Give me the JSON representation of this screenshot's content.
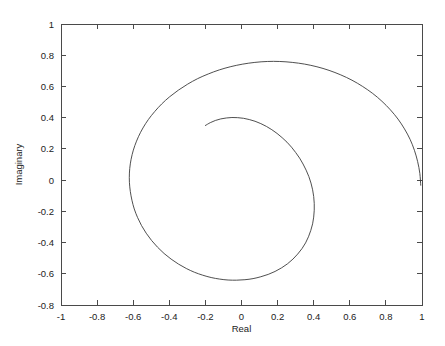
{
  "page": {
    "margin_text": "r\nd\ng",
    "background_color": "#ffffff"
  },
  "chart_data": {
    "type": "line",
    "title": "",
    "subtitle": "",
    "xlabel": "Real",
    "ylabel": "Imaginary",
    "xlim": [
      -1,
      1
    ],
    "ylim": [
      -0.8,
      1
    ],
    "grid": false,
    "legend": null,
    "line_color": "#3b3b3b",
    "axis_color": "#4a4a4a",
    "xticks": [
      -1,
      -0.8,
      -0.6,
      -0.4,
      -0.2,
      0,
      0.2,
      0.4,
      0.6,
      0.8,
      1
    ],
    "xticklabels": [
      "-1",
      "-0.8",
      "-0.6",
      "-0.4",
      "-0.2",
      "0",
      "0.2",
      "0.4",
      "0.6",
      "0.8",
      "1"
    ],
    "yticks": [
      -0.8,
      -0.6,
      -0.4,
      -0.2,
      0,
      0.2,
      0.4,
      0.6,
      0.8,
      1
    ],
    "yticklabels": [
      "-0.8",
      "-0.6",
      "-0.4",
      "-0.2",
      "0",
      "0.2",
      "0.4",
      "0.6",
      "0.8",
      "1"
    ],
    "annotations": [
      {
        "name": "inner-start",
        "x": -0.2,
        "y": 0.35
      },
      {
        "name": "inner-loop-top",
        "x": 0.02,
        "y": 0.4
      },
      {
        "name": "inner-loop-right",
        "x": 0.42,
        "y": 0.02
      },
      {
        "name": "inner-loop-bottom",
        "x": -0.06,
        "y": -0.46
      },
      {
        "name": "inner-loop-left",
        "x": -0.54,
        "y": 0.05
      },
      {
        "name": "mid-loop-top",
        "x": 0.04,
        "y": 0.6
      },
      {
        "name": "mid-loop-right",
        "x": 0.65,
        "y": 0.02
      },
      {
        "name": "mid-loop-bottom",
        "x": -0.08,
        "y": -0.71
      },
      {
        "name": "mid-loop-left",
        "x": -0.83,
        "y": 0.08
      },
      {
        "name": "outer-top",
        "x": 0.05,
        "y": 0.905
      },
      {
        "name": "outer-end",
        "x": 1.0,
        "y": 0.03
      }
    ],
    "series": [
      {
        "name": "spiral",
        "points": [
          [
            -0.2,
            0.35
          ],
          [
            -0.173,
            0.368
          ],
          [
            -0.145,
            0.382
          ],
          [
            -0.115,
            0.392
          ],
          [
            -0.084,
            0.398
          ],
          [
            -0.053,
            0.401
          ],
          [
            -0.021,
            0.4
          ],
          [
            0.011,
            0.396
          ],
          [
            0.043,
            0.388
          ],
          [
            0.075,
            0.377
          ],
          [
            0.107,
            0.362
          ],
          [
            0.138,
            0.344
          ],
          [
            0.168,
            0.323
          ],
          [
            0.197,
            0.299
          ],
          [
            0.225,
            0.272
          ],
          [
            0.252,
            0.243
          ],
          [
            0.277,
            0.211
          ],
          [
            0.3,
            0.177
          ],
          [
            0.322,
            0.141
          ],
          [
            0.341,
            0.103
          ],
          [
            0.358,
            0.064
          ],
          [
            0.373,
            0.023
          ],
          [
            0.385,
            -0.019
          ],
          [
            0.394,
            -0.062
          ],
          [
            0.4,
            -0.105
          ],
          [
            0.403,
            -0.149
          ],
          [
            0.403,
            -0.193
          ],
          [
            0.4,
            -0.237
          ],
          [
            0.394,
            -0.28
          ],
          [
            0.384,
            -0.322
          ],
          [
            0.371,
            -0.363
          ],
          [
            0.355,
            -0.402
          ],
          [
            0.335,
            -0.439
          ],
          [
            0.311,
            -0.474
          ],
          [
            0.285,
            -0.506
          ],
          [
            0.255,
            -0.536
          ],
          [
            0.222,
            -0.562
          ],
          [
            0.186,
            -0.585
          ],
          [
            0.148,
            -0.604
          ],
          [
            0.107,
            -0.619
          ],
          [
            0.064,
            -0.631
          ],
          [
            0.019,
            -0.638
          ],
          [
            -0.027,
            -0.641
          ],
          [
            -0.074,
            -0.64
          ],
          [
            -0.121,
            -0.634
          ],
          [
            -0.168,
            -0.624
          ],
          [
            -0.215,
            -0.609
          ],
          [
            -0.261,
            -0.59
          ],
          [
            -0.306,
            -0.566
          ],
          [
            -0.349,
            -0.538
          ],
          [
            -0.39,
            -0.506
          ],
          [
            -0.429,
            -0.47
          ],
          [
            -0.465,
            -0.43
          ],
          [
            -0.498,
            -0.387
          ],
          [
            -0.528,
            -0.34
          ],
          [
            -0.554,
            -0.291
          ],
          [
            -0.576,
            -0.239
          ],
          [
            -0.594,
            -0.185
          ],
          [
            -0.607,
            -0.129
          ],
          [
            -0.616,
            -0.072
          ],
          [
            -0.621,
            -0.014
          ],
          [
            -0.621,
            0.045
          ],
          [
            -0.616,
            0.104
          ],
          [
            -0.606,
            0.163
          ],
          [
            -0.591,
            0.221
          ],
          [
            -0.571,
            0.278
          ],
          [
            -0.546,
            0.334
          ],
          [
            -0.516,
            0.388
          ],
          [
            -0.481,
            0.439
          ],
          [
            -0.442,
            0.488
          ],
          [
            -0.398,
            0.534
          ],
          [
            -0.35,
            0.576
          ],
          [
            -0.298,
            0.615
          ],
          [
            -0.243,
            0.65
          ],
          [
            -0.184,
            0.68
          ],
          [
            -0.123,
            0.706
          ],
          [
            -0.059,
            0.727
          ],
          [
            0.007,
            0.743
          ],
          [
            0.074,
            0.754
          ],
          [
            0.143,
            0.76
          ],
          [
            0.212,
            0.76
          ],
          [
            0.281,
            0.754
          ],
          [
            0.35,
            0.743
          ],
          [
            0.418,
            0.726
          ],
          [
            0.485,
            0.703
          ],
          [
            0.55,
            0.674
          ],
          [
            0.612,
            0.64
          ],
          [
            0.671,
            0.6
          ],
          [
            0.727,
            0.555
          ],
          [
            0.778,
            0.505
          ],
          [
            0.825,
            0.45
          ],
          [
            0.867,
            0.391
          ],
          [
            0.903,
            0.328
          ],
          [
            0.934,
            0.261
          ],
          [
            0.958,
            0.191
          ],
          [
            0.976,
            0.118
          ],
          [
            0.988,
            0.043
          ],
          [
            0.993,
            -0.033
          ]
        ]
      }
    ]
  },
  "axes": {
    "x_axis_name": "real-axis",
    "y_axis_name": "imaginary-axis"
  }
}
